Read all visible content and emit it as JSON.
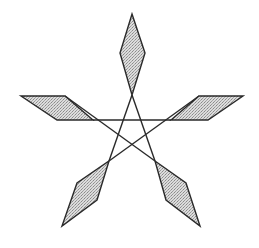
{
  "figure": {
    "title": "",
    "stroke_color": "#2a2a2a",
    "fill_color": "#c8c8c8",
    "fill_style": "stippled-gray",
    "petals": [
      {
        "name": "top",
        "points": [
          [
            132,
            14
          ],
          [
            145,
            53
          ],
          [
            132,
            95
          ],
          [
            120,
            53
          ]
        ]
      },
      {
        "name": "left",
        "points": [
          [
            21,
            96
          ],
          [
            65,
            96
          ],
          [
            93,
            120
          ],
          [
            57,
            120
          ]
        ]
      },
      {
        "name": "right",
        "points": [
          [
            199,
            96
          ],
          [
            243,
            96
          ],
          [
            208,
            120
          ],
          [
            171,
            120
          ]
        ]
      },
      {
        "name": "lower-left",
        "points": [
          [
            109,
            161
          ],
          [
            97,
            200
          ],
          [
            62,
            226
          ],
          [
            77,
            183
          ]
        ]
      },
      {
        "name": "lower-right",
        "points": [
          [
            155,
            161
          ],
          [
            186,
            183
          ],
          [
            200,
            226
          ],
          [
            166,
            200
          ]
        ]
      }
    ],
    "lines": [
      {
        "name": "top-to-lower-left",
        "from": [
          132,
          95
        ],
        "to": [
          109,
          161
        ]
      },
      {
        "name": "top-to-lower-right",
        "from": [
          132,
          95
        ],
        "to": [
          155,
          161
        ]
      },
      {
        "name": "left-to-right-horizontal",
        "from": [
          93,
          120
        ],
        "to": [
          171,
          120
        ]
      },
      {
        "name": "left-to-lower-right",
        "from": [
          65,
          96
        ],
        "to": [
          155,
          161
        ]
      },
      {
        "name": "right-to-lower-left",
        "from": [
          199,
          96
        ],
        "to": [
          109,
          161
        ]
      }
    ]
  }
}
